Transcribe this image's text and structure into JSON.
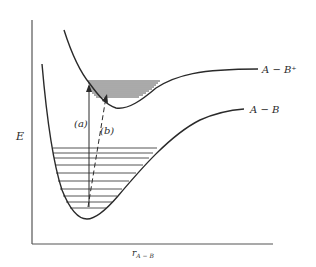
{
  "diagram": {
    "type": "potential-energy-curves",
    "y_axis_label": "E",
    "x_axis_label_main": "r",
    "x_axis_label_sub": "A − B",
    "curves": [
      {
        "name": "A − B⁺",
        "label": "A − B⁺",
        "role": "ionic/excited state"
      },
      {
        "name": "A − B",
        "label": "A − B",
        "role": "ground state"
      }
    ],
    "transitions": [
      {
        "label": "(a)",
        "style": "solid",
        "description": "vertical transition from ground vibrational level"
      },
      {
        "label": "(b)",
        "style": "dashed",
        "description": "transition to upper state minimum"
      }
    ],
    "upper_vibrational_levels": 9,
    "lower_vibrational_levels": 10,
    "colors": {
      "ink": "#2a2a2a",
      "axis": "#555555",
      "background": "#ffffff"
    }
  }
}
